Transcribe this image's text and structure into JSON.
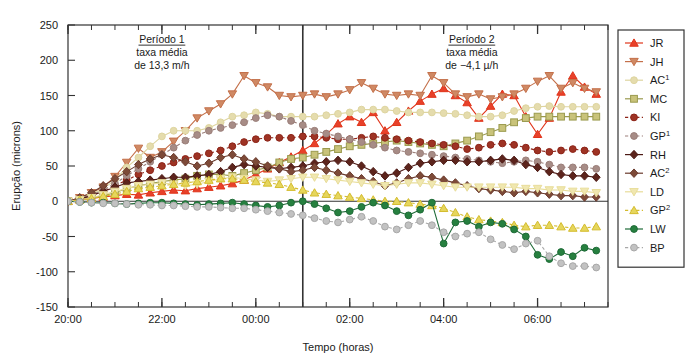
{
  "chart_data": {
    "type": "line",
    "title": "",
    "xlabel": "Tempo (horas)",
    "ylabel": "Erupção (microns)",
    "ylim": [
      -150,
      250
    ],
    "yticks": [
      -150,
      -100,
      -50,
      0,
      50,
      100,
      150,
      200,
      250
    ],
    "ytick_labels": [
      "-150",
      "-100",
      "-50",
      "0",
      "50",
      "100",
      "150",
      "200",
      "250"
    ],
    "xlim": [
      20.0,
      31.5
    ],
    "xticks_major": [
      20,
      22,
      24,
      26,
      28,
      30
    ],
    "xtick_labels": [
      "20:00",
      "22:00",
      "00:00",
      "02:00",
      "04:00",
      "06:00"
    ],
    "xtick_minor_step": 0.5,
    "grid": false,
    "legend_position": "right-outside",
    "divider_x": 25.0,
    "zero_line": 0,
    "annotations": [
      {
        "name": "periodo-1",
        "x": 22.0,
        "y": 225,
        "lines": [
          "Período 1",
          "taxa média",
          "de 13,3 m/h"
        ],
        "underline_first_line": true
      },
      {
        "name": "periodo-2",
        "x": 28.6,
        "y": 225,
        "lines": [
          "Período 2",
          "taxa média",
          "de −4,1 µ/h"
        ],
        "underline_first_line": true
      }
    ],
    "x": [
      20.0,
      20.25,
      20.5,
      20.75,
      21.0,
      21.25,
      21.5,
      21.75,
      22.0,
      22.25,
      22.5,
      22.75,
      23.0,
      23.25,
      23.5,
      23.75,
      24.0,
      24.25,
      24.5,
      24.75,
      25.0,
      25.25,
      25.5,
      25.75,
      26.0,
      26.25,
      26.5,
      26.75,
      27.0,
      27.25,
      27.5,
      27.75,
      28.0,
      28.25,
      28.5,
      28.75,
      29.0,
      29.25,
      29.5,
      29.75,
      30.0,
      30.25,
      30.5,
      30.75,
      31.0,
      31.25
    ],
    "series": [
      {
        "name": "JR",
        "color": "#e0341a",
        "marker": "triangle-up",
        "marker_fill": "#e8412a",
        "dash": false,
        "values": [
          0,
          2,
          4,
          6,
          8,
          10,
          9,
          12,
          14,
          16,
          15,
          18,
          20,
          22,
          25,
          30,
          38,
          46,
          55,
          63,
          72,
          82,
          95,
          110,
          120,
          112,
          126,
          100,
          112,
          128,
          142,
          152,
          160,
          150,
          140,
          118,
          135,
          152,
          150,
          120,
          95,
          118,
          155,
          178,
          162,
          152
        ]
      },
      {
        "name": "JH",
        "color": "#c4704a",
        "marker": "triangle-down",
        "marker_fill": "#cf8964",
        "dash": false,
        "values": [
          0,
          5,
          12,
          20,
          35,
          55,
          75,
          62,
          70,
          85,
          100,
          118,
          128,
          138,
          152,
          178,
          168,
          162,
          150,
          148,
          150,
          152,
          148,
          152,
          158,
          168,
          160,
          152,
          150,
          152,
          150,
          178,
          168,
          152,
          148,
          152,
          145,
          148,
          152,
          160,
          170,
          178,
          160,
          168,
          160,
          155
        ]
      },
      {
        "name": "AC1",
        "label": "AC",
        "superscript": "1",
        "color": "#ded5a0",
        "marker": "circle",
        "marker_fill": "#e5dcad",
        "dash": false,
        "values": [
          0,
          4,
          10,
          18,
          30,
          48,
          62,
          78,
          92,
          100,
          100,
          100,
          104,
          112,
          120,
          122,
          126,
          124,
          120,
          120,
          120,
          120,
          122,
          124,
          126,
          130,
          130,
          130,
          128,
          126,
          126,
          126,
          125,
          124,
          122,
          120,
          120,
          122,
          128,
          132,
          134,
          135,
          134,
          134,
          134,
          134
        ]
      },
      {
        "name": "MC",
        "label": "MC",
        "color": "#9a9a4e",
        "marker": "square",
        "marker_fill": "#c9c37a",
        "dash": false,
        "values": [
          0,
          2,
          5,
          8,
          12,
          18,
          22,
          25,
          28,
          30,
          32,
          36,
          38,
          38,
          36,
          40,
          44,
          48,
          55,
          60,
          62,
          66,
          70,
          74,
          78,
          80,
          82,
          84,
          86,
          84,
          82,
          80,
          78,
          82,
          86,
          92,
          98,
          104,
          112,
          118,
          120,
          120,
          120,
          120,
          120,
          120
        ]
      },
      {
        "name": "KI",
        "label": "KI",
        "color": "#8d2418",
        "marker": "circle",
        "marker_fill": "#9e3324",
        "dash": true,
        "values": [
          0,
          3,
          8,
          14,
          22,
          30,
          38,
          44,
          50,
          55,
          60,
          64,
          68,
          72,
          78,
          84,
          88,
          90,
          90,
          90,
          92,
          92,
          90,
          88,
          88,
          90,
          92,
          90,
          88,
          86,
          84,
          82,
          80,
          78,
          74,
          76,
          80,
          82,
          80,
          76,
          72,
          70,
          72,
          74,
          72,
          70
        ]
      },
      {
        "name": "GP1",
        "label": "GP",
        "superscript": "1",
        "color": "#9b7f7a",
        "marker": "circle",
        "marker_fill": "#a78c86",
        "dash": true,
        "values": [
          0,
          4,
          9,
          16,
          25,
          36,
          46,
          56,
          66,
          76,
          86,
          94,
          100,
          104,
          108,
          112,
          118,
          122,
          120,
          114,
          108,
          100,
          96,
          92,
          88,
          84,
          80,
          76,
          72,
          70,
          68,
          66,
          64,
          62,
          60,
          58,
          56,
          54,
          56,
          58,
          56,
          52,
          48,
          48,
          48,
          46
        ]
      },
      {
        "name": "RH",
        "label": "RH",
        "color": "#4d1a15",
        "marker": "diamond",
        "marker_fill": "#5c241c",
        "dash": false,
        "values": [
          0,
          3,
          8,
          14,
          20,
          26,
          28,
          30,
          32,
          34,
          34,
          36,
          38,
          42,
          48,
          52,
          50,
          48,
          46,
          48,
          50,
          54,
          56,
          58,
          56,
          50,
          42,
          36,
          40,
          48,
          54,
          56,
          58,
          58,
          56,
          56,
          58,
          60,
          58,
          52,
          48,
          42,
          38,
          36,
          36,
          34
        ]
      },
      {
        "name": "AC2",
        "label": "AC",
        "superscript": "2",
        "color": "#6b3b2d",
        "marker": "diamond",
        "marker_fill": "#7d4a38",
        "dash": false,
        "values": [
          0,
          5,
          12,
          22,
          32,
          42,
          52,
          60,
          66,
          62,
          56,
          50,
          54,
          62,
          66,
          60,
          56,
          50,
          46,
          42,
          44,
          48,
          44,
          40,
          36,
          32,
          28,
          22,
          26,
          32,
          36,
          34,
          30,
          26,
          22,
          18,
          16,
          14,
          12,
          14,
          12,
          10,
          8,
          8,
          6,
          6
        ]
      },
      {
        "name": "LD",
        "label": "LD",
        "color": "#e8dd9a",
        "marker": "triangle-down",
        "marker_fill": "#f0e7b0",
        "dash": false,
        "values": [
          0,
          2,
          5,
          9,
          14,
          18,
          22,
          24,
          26,
          24,
          22,
          24,
          28,
          32,
          34,
          32,
          30,
          28,
          30,
          32,
          34,
          34,
          32,
          30,
          28,
          26,
          24,
          22,
          24,
          26,
          26,
          24,
          22,
          20,
          20,
          20,
          20,
          20,
          20,
          18,
          18,
          16,
          16,
          14,
          14,
          12
        ]
      },
      {
        "name": "GP2",
        "label": "GP",
        "superscript": "2",
        "color": "#d4bc2e",
        "marker": "triangle-up",
        "marker_fill": "#e6d65c",
        "dash": true,
        "values": [
          0,
          2,
          4,
          7,
          10,
          14,
          18,
          20,
          22,
          24,
          26,
          28,
          30,
          32,
          32,
          30,
          28,
          26,
          24,
          20,
          16,
          12,
          10,
          8,
          6,
          4,
          2,
          0,
          0,
          -2,
          -4,
          -6,
          -10,
          -16,
          -22,
          -26,
          -28,
          -30,
          -34,
          -36,
          -34,
          -34,
          -36,
          -38,
          -38,
          -36
        ]
      },
      {
        "name": "LW",
        "label": "LW",
        "color": "#1f6b38",
        "marker": "circle",
        "marker_fill": "#26803f",
        "dash": false,
        "values": [
          0,
          -1,
          -2,
          -2,
          -3,
          -4,
          -3,
          -2,
          -2,
          -3,
          -4,
          -5,
          -4,
          -3,
          -2,
          -4,
          -6,
          -8,
          -6,
          -2,
          0,
          -4,
          -10,
          -16,
          -14,
          -8,
          -2,
          -6,
          -14,
          -20,
          -12,
          -2,
          -60,
          -30,
          -28,
          -36,
          -30,
          -32,
          -40,
          -50,
          -76,
          -82,
          -72,
          -78,
          -66,
          -70
        ]
      },
      {
        "name": "BP",
        "label": "BP",
        "color": "#a8a8a8",
        "marker": "circle",
        "marker_fill": "#c2c2c2",
        "dash": true,
        "values": [
          0,
          -1,
          -2,
          -3,
          -3,
          -4,
          -5,
          -5,
          -6,
          -6,
          -7,
          -8,
          -8,
          -9,
          -10,
          -10,
          -12,
          -14,
          -16,
          -18,
          -20,
          -24,
          -28,
          -30,
          -26,
          -22,
          -28,
          -36,
          -40,
          -34,
          -28,
          -34,
          -44,
          -50,
          -46,
          -44,
          -54,
          -62,
          -68,
          -60,
          -56,
          -78,
          -88,
          -92,
          -92,
          -94
        ]
      }
    ]
  }
}
